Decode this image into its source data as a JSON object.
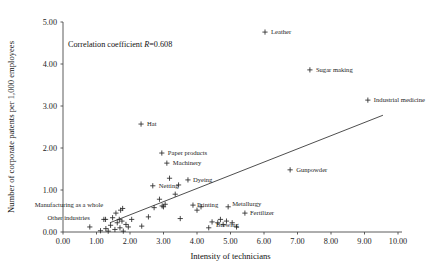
{
  "chart_data": {
    "type": "scatter",
    "title": "",
    "xlabel": "Intensity of technicians",
    "ylabel": "Number of corporate patents per 1,000 employees",
    "xlim": [
      0,
      10
    ],
    "ylim": [
      0,
      5
    ],
    "xticks": [
      "0.00",
      "1.00",
      "2.00",
      "3.00",
      "4.00",
      "5.00",
      "6.00",
      "7.00",
      "8.00",
      "9.00",
      "10.00"
    ],
    "yticks": [
      "0.00",
      "1.00",
      "2.00",
      "3.00",
      "4.00",
      "5.00"
    ],
    "grid": false,
    "legend": "none",
    "annotation": "Correlation coefficient R=0.608",
    "annotation_parts": {
      "prefix": "Correlation coefficient ",
      "symbol": "R",
      "equals": "=",
      "value": "0.608"
    },
    "trend_line": {
      "x0": 1.4,
      "y0": 0.22,
      "x1": 9.55,
      "y1": 2.78
    },
    "labeled_points": [
      {
        "label": "Leather",
        "x": 6.03,
        "y": 4.76,
        "label_dx": 6,
        "label_dy": 2
      },
      {
        "label": "Sugar making",
        "x": 7.37,
        "y": 3.86,
        "label_dx": 6,
        "label_dy": 2
      },
      {
        "label": "Industrial medicine",
        "x": 9.1,
        "y": 3.14,
        "label_dx": 6,
        "label_dy": 2
      },
      {
        "label": "Hat",
        "x": 2.33,
        "y": 2.57,
        "label_dx": 6,
        "label_dy": 2
      },
      {
        "label": "Paper products",
        "x": 2.95,
        "y": 1.88,
        "label_dx": 6,
        "label_dy": 2
      },
      {
        "label": "Machinery",
        "x": 3.1,
        "y": 1.64,
        "label_dx": 6,
        "label_dy": 2
      },
      {
        "label": "Dyeing",
        "x": 3.73,
        "y": 1.24,
        "label_dx": 5,
        "label_dy": 2
      },
      {
        "label": "Netting",
        "x": 2.68,
        "y": 1.1,
        "label_dx": 6,
        "label_dy": 2
      },
      {
        "label": "Gunpowder",
        "x": 6.78,
        "y": 1.48,
        "label_dx": 6,
        "label_dy": 2
      },
      {
        "label": "Printing",
        "x": 3.88,
        "y": 0.64,
        "label_dx": 4,
        "label_dy": 2
      },
      {
        "label": "Metallurgy",
        "x": 4.93,
        "y": 0.6,
        "label_dx": 4,
        "label_dy": -1
      },
      {
        "label": "Fertilizer",
        "x": 5.43,
        "y": 0.45,
        "label_dx": 5,
        "label_dy": 2
      },
      {
        "label": "Brewing",
        "x": 4.45,
        "y": 0.24,
        "label_dx": 4,
        "label_dy": 5
      },
      {
        "label": "Manufacturing as a whole",
        "x": 1.78,
        "y": 0.56,
        "label_dx": -88,
        "label_dy": -1
      },
      {
        "label": "Other industries",
        "x": 1.27,
        "y": 0.3,
        "label_dx": -58,
        "label_dy": 1
      }
    ],
    "unlabeled_points": [
      {
        "x": 0.8,
        "y": 0.12
      },
      {
        "x": 1.12,
        "y": 0.03
      },
      {
        "x": 1.22,
        "y": 0.3
      },
      {
        "x": 1.28,
        "y": 0.08
      },
      {
        "x": 1.35,
        "y": 0.02
      },
      {
        "x": 1.42,
        "y": 0.16
      },
      {
        "x": 1.48,
        "y": 0.34
      },
      {
        "x": 1.55,
        "y": 0.06
      },
      {
        "x": 1.58,
        "y": 0.45
      },
      {
        "x": 1.62,
        "y": 0.22
      },
      {
        "x": 1.68,
        "y": 0.3
      },
      {
        "x": 1.7,
        "y": 0.1
      },
      {
        "x": 1.72,
        "y": 0.52
      },
      {
        "x": 1.76,
        "y": 0.26
      },
      {
        "x": 1.8,
        "y": 0.02
      },
      {
        "x": 1.88,
        "y": 0.18
      },
      {
        "x": 1.95,
        "y": 0.12
      },
      {
        "x": 2.05,
        "y": 0.3
      },
      {
        "x": 2.35,
        "y": 0.14
      },
      {
        "x": 2.55,
        "y": 0.36
      },
      {
        "x": 2.72,
        "y": 0.58
      },
      {
        "x": 2.88,
        "y": 0.78
      },
      {
        "x": 2.96,
        "y": 0.62
      },
      {
        "x": 3.0,
        "y": 0.6
      },
      {
        "x": 3.05,
        "y": 0.66
      },
      {
        "x": 3.18,
        "y": 1.28
      },
      {
        "x": 3.35,
        "y": 0.9
      },
      {
        "x": 3.45,
        "y": 1.12
      },
      {
        "x": 3.5,
        "y": 0.32
      },
      {
        "x": 4.0,
        "y": 0.52
      },
      {
        "x": 4.12,
        "y": 0.6
      },
      {
        "x": 4.35,
        "y": 0.1
      },
      {
        "x": 4.62,
        "y": 0.22
      },
      {
        "x": 4.7,
        "y": 0.3
      },
      {
        "x": 4.78,
        "y": 0.18
      },
      {
        "x": 4.88,
        "y": 0.26
      },
      {
        "x": 5.05,
        "y": 0.22
      },
      {
        "x": 5.18,
        "y": 0.12
      }
    ]
  }
}
